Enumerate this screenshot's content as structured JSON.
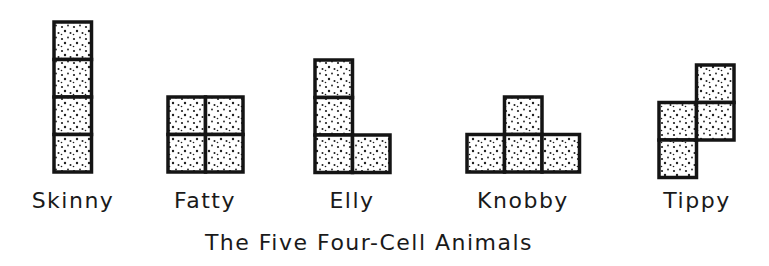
{
  "title": "The Five Four-Cell Animals",
  "colors": {
    "ink": "#141414",
    "fill": "#ffffff",
    "dot": "#1e1e1e"
  },
  "animals": [
    {
      "name": "Skinny",
      "cells": [
        [
          0,
          0
        ],
        [
          0,
          1
        ],
        [
          0,
          2
        ],
        [
          0,
          3
        ]
      ]
    },
    {
      "name": "Fatty",
      "cells": [
        [
          0,
          0
        ],
        [
          1,
          0
        ],
        [
          0,
          1
        ],
        [
          1,
          1
        ]
      ]
    },
    {
      "name": "Elly",
      "cells": [
        [
          0,
          0
        ],
        [
          0,
          1
        ],
        [
          0,
          2
        ],
        [
          1,
          2
        ]
      ]
    },
    {
      "name": "Knobby",
      "cells": [
        [
          1,
          0
        ],
        [
          0,
          1
        ],
        [
          1,
          1
        ],
        [
          2,
          1
        ]
      ]
    },
    {
      "name": "Tippy",
      "cells": [
        [
          1,
          0
        ],
        [
          0,
          1
        ],
        [
          1,
          1
        ],
        [
          0,
          2
        ]
      ]
    }
  ]
}
